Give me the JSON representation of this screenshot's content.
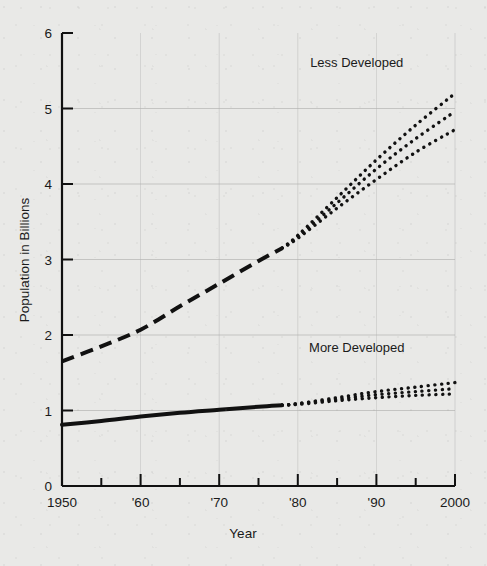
{
  "chart_data": {
    "type": "line",
    "title": "",
    "xlabel": "Year",
    "ylabel": "Population in Billions",
    "xlim": [
      1950,
      2000
    ],
    "ylim": [
      0,
      6
    ],
    "grid": true,
    "legend_position": "inline-annotation",
    "y_ticks": [
      "0",
      "1",
      "2",
      "3",
      "4",
      "5",
      "6"
    ],
    "y_tick_values": [
      0,
      1,
      2,
      3,
      4,
      5,
      6
    ],
    "x_ticks_major": [
      1950,
      1955,
      1960,
      1965,
      1970,
      1975,
      1980,
      1985,
      1990,
      1995,
      2000
    ],
    "x_tick_labels": [
      {
        "value": 1950,
        "label": "1950"
      },
      {
        "value": 1960,
        "label": "'60"
      },
      {
        "value": 1970,
        "label": "'70"
      },
      {
        "value": 1980,
        "label": "'80"
      },
      {
        "value": 1990,
        "label": "'90"
      },
      {
        "value": 2000,
        "label": "2000"
      }
    ],
    "annotations": [
      {
        "text": "Less Developed",
        "x": 1987.5,
        "y": 5.55
      },
      {
        "text": "More Developed",
        "x": 1987.5,
        "y": 1.78
      }
    ],
    "series": [
      {
        "name": "Less Developed",
        "style": "dashed",
        "phase": "historical",
        "x": [
          1950,
          1955,
          1960,
          1965,
          1970,
          1975,
          1978
        ],
        "values": [
          1.65,
          1.85,
          2.07,
          2.38,
          2.68,
          2.98,
          3.15
        ]
      },
      {
        "name": "Less Developed (high projection)",
        "style": "dotted",
        "phase": "projection",
        "x": [
          1978,
          1980,
          1985,
          1990,
          1995,
          2000
        ],
        "values": [
          3.15,
          3.32,
          3.82,
          4.32,
          4.78,
          5.2
        ]
      },
      {
        "name": "Less Developed (medium projection)",
        "style": "dotted",
        "phase": "projection",
        "x": [
          1978,
          1980,
          1985,
          1990,
          1995,
          2000
        ],
        "values": [
          3.15,
          3.3,
          3.75,
          4.2,
          4.6,
          4.96
        ]
      },
      {
        "name": "Less Developed (low projection)",
        "style": "dotted",
        "phase": "projection",
        "x": [
          1978,
          1980,
          1985,
          1990,
          1995,
          2000
        ],
        "values": [
          3.15,
          3.28,
          3.68,
          4.06,
          4.42,
          4.72
        ]
      },
      {
        "name": "More Developed",
        "style": "solid",
        "phase": "historical",
        "x": [
          1950,
          1955,
          1960,
          1965,
          1970,
          1975,
          1978
        ],
        "values": [
          0.81,
          0.86,
          0.92,
          0.97,
          1.01,
          1.05,
          1.07
        ]
      },
      {
        "name": "More Developed (high projection)",
        "style": "dotted",
        "phase": "projection",
        "x": [
          1978,
          1980,
          1985,
          1990,
          1995,
          2000
        ],
        "values": [
          1.07,
          1.09,
          1.17,
          1.25,
          1.31,
          1.37
        ]
      },
      {
        "name": "More Developed (medium projection)",
        "style": "dotted",
        "phase": "projection",
        "x": [
          1978,
          1980,
          1985,
          1990,
          1995,
          2000
        ],
        "values": [
          1.07,
          1.09,
          1.15,
          1.21,
          1.25,
          1.29
        ]
      },
      {
        "name": "More Developed (low projection)",
        "style": "dotted",
        "phase": "projection",
        "x": [
          1978,
          1980,
          1985,
          1990,
          1995,
          2000
        ],
        "values": [
          1.07,
          1.08,
          1.13,
          1.17,
          1.2,
          1.22
        ]
      }
    ],
    "colors": {
      "line": "#111111",
      "axis": "#111111",
      "grid": "#b4b4b2",
      "background": "#e9e9e7",
      "text": "#1a1a1a"
    }
  },
  "axes": {
    "y_title": "Population in Billions",
    "x_title": "Year"
  },
  "labels": {
    "less_developed": "Less Developed",
    "more_developed": "More Developed"
  }
}
